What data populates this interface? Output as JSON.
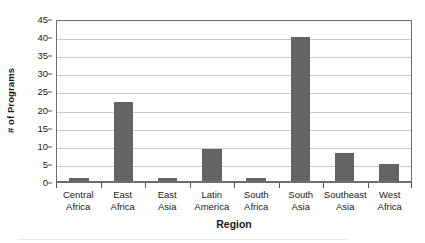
{
  "chart_data": {
    "type": "bar",
    "title": "",
    "xlabel": "Region",
    "ylabel": "# of Programs",
    "categories": [
      "Central Africa",
      "East Africa",
      "East Asia",
      "Latin America",
      "South Africa",
      "South Asia",
      "Southeast Asia",
      "West Africa"
    ],
    "category_lines": [
      [
        "Central",
        "Africa"
      ],
      [
        "East",
        "Africa"
      ],
      [
        "East",
        "Asia"
      ],
      [
        "Latin",
        "America"
      ],
      [
        "South",
        "Africa"
      ],
      [
        "South",
        "Asia"
      ],
      [
        "Southeast",
        "Asia"
      ],
      [
        "West",
        "Africa"
      ]
    ],
    "values": [
      1,
      22,
      1,
      9,
      1,
      40,
      8,
      5
    ],
    "ylim": [
      0,
      45
    ],
    "ytick_step": 5,
    "yticks": [
      0,
      5,
      10,
      15,
      20,
      25,
      30,
      35,
      40,
      45
    ],
    "ytick_labels": [
      "0",
      "5",
      "10",
      "15",
      "20",
      "25",
      "30",
      "35",
      "40",
      "45"
    ],
    "grid": true,
    "grid_axis": "y",
    "legend": false,
    "legend_position": "none",
    "bar_color": "#646464",
    "gridline_color": "#c9c9c9",
    "axis_color": "#6e6e6e",
    "background_color": "#ffffff",
    "text_color": "#1a1a1a"
  }
}
